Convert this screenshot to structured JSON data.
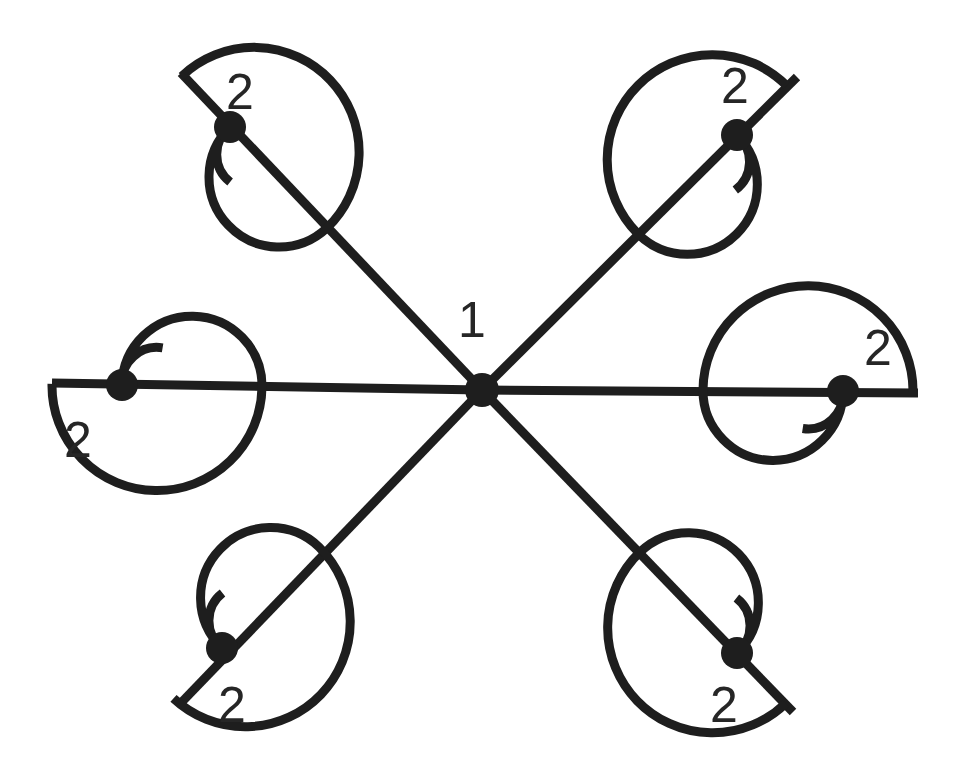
{
  "diagram": {
    "type": "hub-and-spoke line diagram with spiral terminals",
    "stroke_color": "#1e1e1e",
    "label_color": "#262626",
    "background": "#ffffff",
    "stroke_width": 9,
    "node_radius": 16,
    "hub": {
      "x": 482,
      "y": 390,
      "label": "1",
      "label_x": 472,
      "label_y": 320
    },
    "arms": [
      {
        "name": "top-left",
        "corner": [
          181,
          73
        ],
        "node": [
          230,
          127
        ],
        "side": -1,
        "label": "2",
        "label_x": 240,
        "label_y": 92
      },
      {
        "name": "top-right",
        "corner": [
          797,
          77
        ],
        "node": [
          737,
          135
        ],
        "side": 1,
        "label": "2",
        "label_x": 735,
        "label_y": 86
      },
      {
        "name": "left",
        "corner": [
          52,
          383
        ],
        "node": [
          122,
          385
        ],
        "side": 1,
        "label": "2",
        "label_x": 78,
        "label_y": 440
      },
      {
        "name": "right",
        "corner": [
          918,
          393
        ],
        "node": [
          843,
          391
        ],
        "side": 1,
        "label": "2",
        "label_x": 878,
        "label_y": 348
      },
      {
        "name": "bottom-left",
        "corner": [
          178,
          706
        ],
        "node": [
          222,
          648
        ],
        "side": 1,
        "label": "2",
        "label_x": 232,
        "label_y": 705
      },
      {
        "name": "bottom-right",
        "corner": [
          793,
          712
        ],
        "node": [
          737,
          653
        ],
        "side": -1,
        "label": "2",
        "label_x": 724,
        "label_y": 705
      }
    ],
    "spiral": {
      "outer_radius": 105,
      "middle_radius": 70,
      "inner_radius": 35
    }
  }
}
